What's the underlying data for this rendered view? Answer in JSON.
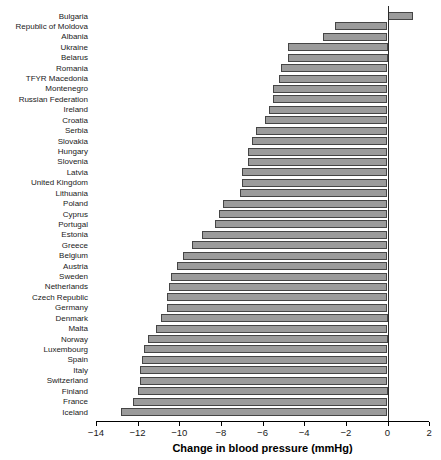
{
  "chart_data": {
    "type": "bar",
    "orientation": "horizontal",
    "title": "",
    "xlabel": "Change in blood pressure (mmHg)",
    "ylabel": "",
    "xlim": [
      -14,
      2
    ],
    "xticks": [
      -14,
      -12,
      -10,
      -8,
      -6,
      -4,
      -2,
      0,
      2
    ],
    "grid": false,
    "zero_line": true,
    "legend": "none",
    "bar_color": "#9b9b9b",
    "bar_border_color": "#454545",
    "categories": [
      "Bulgaria",
      "Republic of Moldova",
      "Albania",
      "Ukraine",
      "Belarus",
      "Romania",
      "TFYR Macedonia",
      "Montenegro",
      "Russian Federation",
      "Ireland",
      "Croatia",
      "Serbia",
      "Slovakia",
      "Hungary",
      "Slovenia",
      "Latvia",
      "United Kingdom",
      "Lithuania",
      "Poland",
      "Cyprus",
      "Portugal",
      "Estonia",
      "Greece",
      "Belgium",
      "Austria",
      "Sweden",
      "Netherlands",
      "Czech Republic",
      "Germany",
      "Denmark",
      "Malta",
      "Norway",
      "Luxembourg",
      "Spain",
      "Italy",
      "Switzerland",
      "Finland",
      "France",
      "Iceland"
    ],
    "values": [
      1.2,
      -2.5,
      -3.1,
      -4.8,
      -4.8,
      -5.1,
      -5.2,
      -5.5,
      -5.5,
      -5.7,
      -5.9,
      -6.3,
      -6.5,
      -6.7,
      -6.7,
      -7.0,
      -7.0,
      -7.1,
      -7.9,
      -8.1,
      -8.3,
      -8.9,
      -9.4,
      -9.8,
      -10.1,
      -10.4,
      -10.5,
      -10.6,
      -10.6,
      -10.9,
      -11.1,
      -11.5,
      -11.7,
      -11.8,
      -11.9,
      -11.9,
      -12.0,
      -12.2,
      -12.8
    ]
  }
}
